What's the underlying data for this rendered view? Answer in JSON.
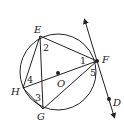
{
  "diagram": {
    "type": "circle-geometry",
    "circle": {
      "center_label": "O",
      "cx": 58,
      "cy": 72,
      "r": 38
    },
    "points": {
      "E": {
        "label": "E",
        "x": 40,
        "y": 36
      },
      "F": {
        "label": "F",
        "x": 97,
        "y": 61
      },
      "H": {
        "label": "H",
        "x": 23,
        "y": 88
      },
      "G": {
        "label": "G",
        "x": 43,
        "y": 109
      },
      "O": {
        "label": "O",
        "x": 58,
        "y": 73
      },
      "D": {
        "label": "D",
        "x": 109,
        "y": 99
      }
    },
    "segments": [
      "EF",
      "EG",
      "EH",
      "HF",
      "HG",
      "GF"
    ],
    "tangent_line": {
      "through": [
        "F",
        "D"
      ],
      "label": "line FD tangent at F"
    },
    "angle_labels": [
      {
        "id": "1",
        "text": "1"
      },
      {
        "id": "2",
        "text": "2"
      },
      {
        "id": "3",
        "text": "3"
      },
      {
        "id": "4",
        "text": "4"
      },
      {
        "id": "5",
        "text": "5"
      }
    ],
    "color": "#222222"
  }
}
